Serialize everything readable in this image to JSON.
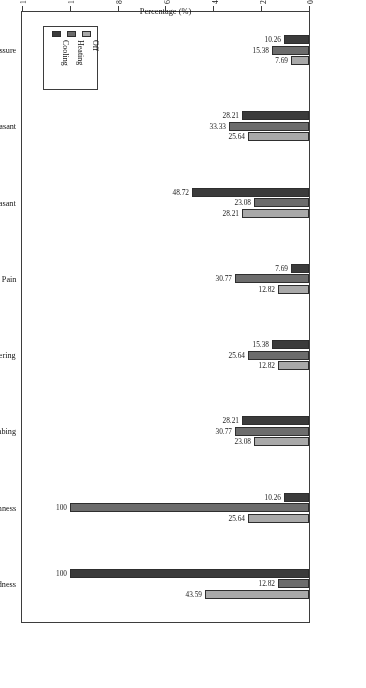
{
  "chart_data": {
    "type": "bar",
    "orientation": "horizontal",
    "title": "",
    "xlabel": "Percentage (%)",
    "ylabel": "",
    "xlim": [
      0,
      120
    ],
    "xticks": [
      0,
      20,
      40,
      60,
      80,
      100,
      120
    ],
    "grid": false,
    "legend_position": "upper-right",
    "rotated_180": true,
    "categories": [
      "Coldness",
      "Warmness",
      "Numbing",
      "Lingering",
      "Pain",
      "Pleasant",
      "Unpleasant",
      "Pressure"
    ],
    "series": [
      {
        "name": "Off",
        "color": "#a9a9a9",
        "values": [
          43.59,
          25.64,
          23.08,
          12.82,
          12.82,
          28.21,
          25.64,
          7.69
        ],
        "labels": [
          "43.59",
          "25.64",
          "23.08",
          "12.82",
          "12.82",
          "28.21",
          "25.64",
          "7.69"
        ]
      },
      {
        "name": "Heating",
        "color": "#6c6c6c",
        "values": [
          12.82,
          100,
          30.77,
          25.64,
          30.77,
          23.08,
          33.33,
          15.38
        ],
        "labels": [
          "12.82",
          "100",
          "30.77",
          "25.64",
          "30.77",
          "23.08",
          "33.33",
          "15.38"
        ]
      },
      {
        "name": "Cooling",
        "color": "#3b3b3b",
        "values": [
          100,
          10.26,
          28.21,
          15.38,
          7.69,
          48.72,
          28.21,
          10.26
        ],
        "labels": [
          "100",
          "10.26",
          "28.21",
          "15.38",
          "7.69",
          "48.72",
          "28.21",
          "10.26"
        ]
      }
    ]
  },
  "axis": {
    "title": "Percentage (%)",
    "tick_labels": [
      "0",
      "20",
      "40",
      "60",
      "80",
      "100",
      "120"
    ]
  },
  "legend": {
    "items": [
      {
        "label": "Off",
        "color": "#a9a9a9"
      },
      {
        "label": "Heating",
        "color": "#6c6c6c"
      },
      {
        "label": "Cooling",
        "color": "#3b3b3b"
      }
    ]
  },
  "categories": [
    "Coldness",
    "Warmness",
    "Numbing",
    "Lingering",
    "Pain",
    "Pleasant",
    "Unpleasant",
    "Pressure"
  ]
}
